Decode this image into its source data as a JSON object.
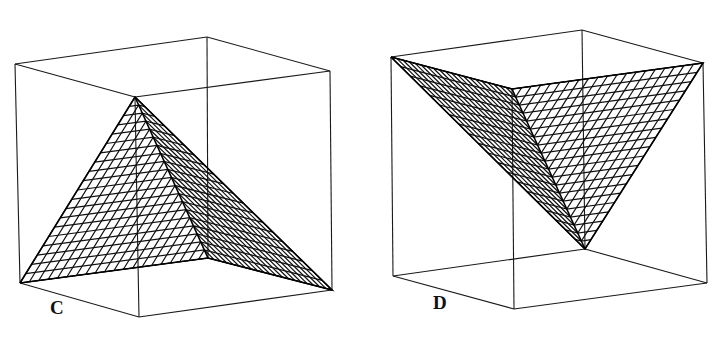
{
  "panels": [
    {
      "label": "C",
      "label_pos": [
        50,
        297
      ],
      "cube": {
        "top": [
          [
            15,
            64
          ],
          [
            207,
            37
          ],
          [
            330,
            71
          ],
          [
            135,
            97
          ]
        ],
        "bottom": [
          [
            20,
            283
          ],
          [
            208,
            258
          ],
          [
            332,
            290
          ],
          [
            139,
            317
          ]
        ]
      },
      "surface": {
        "A": [
          20,
          283
        ],
        "B": [
          135,
          97
        ],
        "C": [
          332,
          290
        ],
        "D": [
          208,
          258
        ],
        "divisions": 20
      }
    },
    {
      "label": "D",
      "label_pos": [
        433,
        292
      ],
      "cube": {
        "top": [
          [
            391,
            57
          ],
          [
            582,
            30
          ],
          [
            703,
            63
          ],
          [
            512,
            89
          ]
        ],
        "bottom": [
          [
            393,
            276
          ],
          [
            585,
            249
          ],
          [
            707,
            283
          ],
          [
            514,
            309
          ]
        ]
      },
      "surface": {
        "A": [
          391,
          57
        ],
        "B": [
          512,
          89
        ],
        "C": [
          703,
          63
        ],
        "D": [
          585,
          249
        ],
        "divisions": 20
      }
    }
  ]
}
